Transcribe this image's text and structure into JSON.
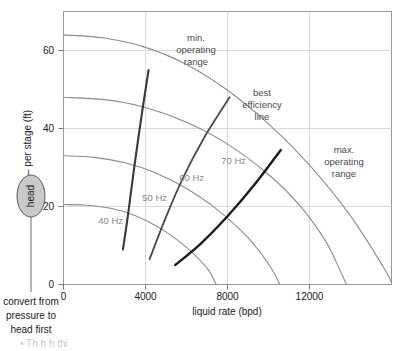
{
  "chart_data": {
    "type": "line",
    "title": "",
    "xlabel": "liquid rate (bpd)",
    "ylabel": "head – per stage (ft)",
    "xlim": [
      0,
      16000
    ],
    "ylim": [
      0,
      70
    ],
    "xticks": [
      0,
      4000,
      8000,
      12000
    ],
    "xtick_labels": [
      "0",
      "4000",
      "8000",
      "12000"
    ],
    "yticks": [
      0,
      20,
      40,
      60
    ],
    "ytick_labels": [
      "0",
      "20",
      "40",
      "60"
    ],
    "grid": true,
    "legend_position": "inline-labels",
    "series": [
      {
        "name": "40 Hz",
        "color": "#8c8c8c",
        "label_position": {
          "x": 2300,
          "y": 15.5
        },
        "points": [
          {
            "x": 0,
            "y": 20.5
          },
          {
            "x": 1000,
            "y": 20.4
          },
          {
            "x": 2000,
            "y": 19.8
          },
          {
            "x": 3000,
            "y": 18.6
          },
          {
            "x": 4000,
            "y": 16.5
          },
          {
            "x": 5000,
            "y": 13.5
          },
          {
            "x": 6000,
            "y": 9.5
          },
          {
            "x": 7000,
            "y": 4.2
          },
          {
            "x": 7450,
            "y": 0.0
          }
        ]
      },
      {
        "name": "50 Hz",
        "color": "#8c8c8c",
        "label_position": {
          "x": 4450,
          "y": 21.5
        },
        "points": [
          {
            "x": 0,
            "y": 33.0
          },
          {
            "x": 1500,
            "y": 32.6
          },
          {
            "x": 3000,
            "y": 31.2
          },
          {
            "x": 4500,
            "y": 28.6
          },
          {
            "x": 6000,
            "y": 24.6
          },
          {
            "x": 7500,
            "y": 19.2
          },
          {
            "x": 9000,
            "y": 12.0
          },
          {
            "x": 10100,
            "y": 4.5
          },
          {
            "x": 10550,
            "y": 0.0
          }
        ]
      },
      {
        "name": "60 Hz",
        "color": "#8c8c8c",
        "label_position": {
          "x": 6250,
          "y": 26.5
        },
        "points": [
          {
            "x": 0,
            "y": 48.0
          },
          {
            "x": 2000,
            "y": 47.4
          },
          {
            "x": 4000,
            "y": 45.4
          },
          {
            "x": 6000,
            "y": 41.6
          },
          {
            "x": 8000,
            "y": 36.0
          },
          {
            "x": 10000,
            "y": 28.2
          },
          {
            "x": 11500,
            "y": 20.4
          },
          {
            "x": 12800,
            "y": 11.0
          },
          {
            "x": 13500,
            "y": 3.5
          },
          {
            "x": 13800,
            "y": 0.0
          }
        ]
      },
      {
        "name": "70 Hz",
        "color": "#8c8c8c",
        "label_position": {
          "x": 8300,
          "y": 31.0
        },
        "points": [
          {
            "x": 0,
            "y": 64.0
          },
          {
            "x": 2000,
            "y": 63.2
          },
          {
            "x": 4000,
            "y": 60.8
          },
          {
            "x": 6000,
            "y": 56.4
          },
          {
            "x": 8000,
            "y": 49.8
          },
          {
            "x": 10000,
            "y": 41.2
          },
          {
            "x": 12000,
            "y": 30.6
          },
          {
            "x": 14000,
            "y": 17.6
          },
          {
            "x": 15600,
            "y": 4.5
          },
          {
            "x": 16000,
            "y": 0.5
          }
        ]
      }
    ],
    "annotations": [
      {
        "name": "min-operating-range",
        "label_lines": [
          "min.",
          "operating",
          "range"
        ],
        "color": "#3a3a3a",
        "curve_points": [
          {
            "x": 2900,
            "y": 9.0
          },
          {
            "x": 3150,
            "y": 18.0
          },
          {
            "x": 3450,
            "y": 30.0
          },
          {
            "x": 3800,
            "y": 43.0
          },
          {
            "x": 4150,
            "y": 55.0
          }
        ]
      },
      {
        "name": "best-efficiency-line",
        "label_lines": [
          "best",
          "efficiency",
          "line"
        ],
        "color": "#4a4a4a",
        "curve_points": [
          {
            "x": 4200,
            "y": 6.5
          },
          {
            "x": 4900,
            "y": 16.0
          },
          {
            "x": 5800,
            "y": 27.0
          },
          {
            "x": 6900,
            "y": 38.0
          },
          {
            "x": 8100,
            "y": 48.0
          }
        ]
      },
      {
        "name": "max-operating-range",
        "label_lines": [
          "max.",
          "operating",
          "range"
        ],
        "color": "#1c1c1c",
        "curve_points": [
          {
            "x": 5450,
            "y": 5.0
          },
          {
            "x": 6700,
            "y": 10.5
          },
          {
            "x": 8000,
            "y": 17.5
          },
          {
            "x": 9300,
            "y": 25.5
          },
          {
            "x": 10600,
            "y": 34.5
          }
        ]
      }
    ]
  },
  "callouts": {
    "head_pill_label": "head",
    "bottom_note_lines": [
      "convert from",
      "pressure to",
      "head first"
    ]
  },
  "footer": {
    "partial_text": "•  Th     h  h     thi"
  }
}
